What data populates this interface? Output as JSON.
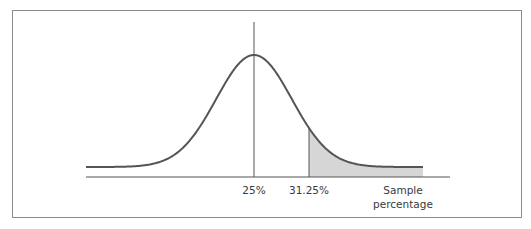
{
  "chart_data": {
    "type": "area",
    "title": "",
    "xlabel": "Sample percentage",
    "ylabel": "",
    "distribution": "normal",
    "mean": 25,
    "sd": 4.3,
    "xlim": [
      10,
      40
    ],
    "shaded_from": 31.25,
    "shaded_to": 40,
    "ticks": [
      {
        "value": 25,
        "label": "25%"
      },
      {
        "value": 31.25,
        "label": "31.25%"
      }
    ],
    "axis_label_lines": [
      "Sample",
      "percentage"
    ],
    "grid": false,
    "legend": "none",
    "colors": {
      "curve": "#555555",
      "shade": "#d6d6d6",
      "axis": "#555555",
      "frame": "#8a8a8a"
    }
  }
}
